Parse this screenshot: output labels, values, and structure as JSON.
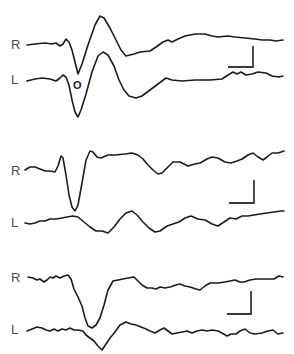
{
  "figure": {
    "panels": [
      {
        "id": "panel-1",
        "traces": [
          {
            "label": "R",
            "points": "27,45 35,44 45,43 52,44 56,43 60,46 63,44 66,39 69,42 72,50 75,62 78,74 82,64 88,45 95,25 100,16 104,18 110,28 116,40 121,50 126,56 134,54 140,52 150,51 156,47 163,42 168,40 172,42 178,39 185,36 195,34 205,34 212,36 218,37 228,36 235,37 245,38 255,39 262,40 270,40 276,41 283,40"
          },
          {
            "label": "L",
            "points": "27,81 35,79 42,78 50,79 56,81 60,78 63,75 66,77 69,85 72,100 75,112 78,117 81,110 86,94 92,72 98,56 103,52 108,55 114,66 119,80 124,90 129,96 136,98 142,96 150,90 158,84 166,78 172,80 182,81 195,80 210,80 222,79 228,75 233,72 237,74 241,72 246,75 252,74 258,72 266,73 272,76 279,77 283,76"
          }
        ],
        "annotations": [
          {
            "text": "O",
            "x": 73,
            "y": 80
          }
        ],
        "scalebar": {
          "vx": 253,
          "vy1": 46,
          "vy2": 67,
          "hx1": 228,
          "hx2": 253
        }
      },
      {
        "id": "panel-2",
        "traces": [
          {
            "label": "R",
            "points": "25,170 30,167 35,167 40,169 45,171 50,171 55,172 58,166 61,156 63,158 66,175 69,195 72,207 75,211 78,205 82,183 86,160 90,151 93,152 97,157 101,158 108,155 115,155 125,154 132,153 138,155 143,159 148,165 153,170 158,174 162,173 168,167 173,162 180,162 188,166 195,164 200,163 207,159 212,157 218,158 225,162 231,163 237,161 242,159 248,155 253,153 258,157 263,160 267,157 272,153 278,153 284,151"
          },
          {
            "label": "L",
            "points": "25,223 30,224 35,223 40,221 45,221 50,219 56,219 62,218 67,217 73,216 78,217 84,222 90,227 96,231 102,231 108,233 114,227 120,219 126,213 132,211 137,215 143,222 149,228 155,232 160,231 167,226 173,224 179,222 185,218 191,216 198,219 205,220 212,224 218,226 224,222 230,218 236,219 242,216 248,216 254,215 260,214 267,213 274,212 281,211 284,211"
          }
        ],
        "annotations": [],
        "scalebar": {
          "vx": 254,
          "vy1": 180,
          "vy2": 203,
          "hx1": 229,
          "hx2": 254
        }
      },
      {
        "id": "panel-3",
        "traces": [
          {
            "label": "R",
            "points": "28,277 33,278 37,280 40,279 44,282 47,280 50,277 53,278 56,276 60,278 64,276 68,275 71,279 74,289 78,297 82,306 85,318 88,326 92,328 96,325 100,318 104,305 108,290 113,281 118,280 123,279 128,278 134,277 137,280 142,285 147,288 152,288 156,289 160,287 165,288 170,287 176,285 180,284 185,286 190,287 196,289 200,290 205,286 210,283 218,283 225,282 230,281 235,280 240,282 244,282 250,280 256,279 262,279 268,279 274,279 279,276 283,277"
          },
          {
            "label": "L",
            "points": "27,331 32,329 37,327 42,328 46,330 50,331 54,329 58,331 62,329 66,330 70,328 74,330 78,330 83,331 86,335 90,338 94,341 98,346 102,350 106,344 110,338 115,332 120,325 126,322 131,324 136,325 141,327 146,329 150,331 155,333 160,330 164,328 168,331 172,334 177,333 182,332 187,331 192,333 197,331 202,330 207,331 212,330 218,331 222,333 227,336 231,334 236,334 240,331 245,329 250,333 255,334 262,333 268,331 273,330 278,334 283,333"
          }
        ],
        "annotations": [],
        "scalebar": {
          "vx": 251,
          "vy1": 291,
          "vy2": 314,
          "hx1": 227,
          "hx2": 251
        }
      }
    ],
    "labels": [
      {
        "text": "R",
        "x": 11,
        "y": 38
      },
      {
        "text": "L",
        "x": 11,
        "y": 73
      },
      {
        "text": "R",
        "x": 11,
        "y": 164
      },
      {
        "text": "L",
        "x": 11,
        "y": 216
      },
      {
        "text": "R",
        "x": 11,
        "y": 271
      },
      {
        "text": "L",
        "x": 11,
        "y": 323
      }
    ],
    "colors": {
      "trace": "#1c1c1c",
      "scalebar": "#3a3a3a",
      "label": "#4a4a4a",
      "background": "#ffffff"
    }
  }
}
